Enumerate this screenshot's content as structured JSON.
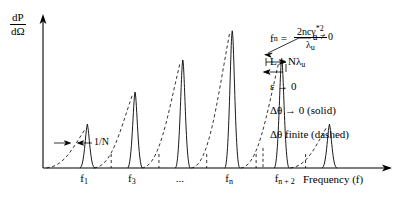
{
  "axes": {
    "y_label_numerator": "dP",
    "y_label_denominator": "dΩ",
    "x_title": "Frequency (f)"
  },
  "annotations": {
    "width_label": "1/N",
    "aperture_label": "a ≠ 0"
  },
  "equations": {
    "fn_lhs": "f",
    "fn_sub": "n",
    "fn_eq": "=",
    "fn_num": "2ncγ*2",
    "fn_den": "λu",
    "line_L": "L = Nλu",
    "line_eps": "ε → 0",
    "line_solid": "Δθ → 0 (solid)",
    "line_dashed": "Δθ  finite (dashed)"
  },
  "chart_data": {
    "type": "line",
    "title": "",
    "xlabel": "Frequency (f)",
    "ylabel": "dP/dΩ",
    "grid": false,
    "legend_position": "right",
    "xlim": [
      0,
      100
    ],
    "ylim": [
      0,
      100
    ],
    "axis_tick_labels": [
      {
        "text": "f",
        "sub": "1",
        "x": 13.0
      },
      {
        "text": "f",
        "sub": "3",
        "x": 27.0
      },
      {
        "text": "...",
        "sub": "",
        "x": 41.0
      },
      {
        "text": "f",
        "sub": "n",
        "x": 55.5
      },
      {
        "text": "f",
        "sub": "n + 2",
        "x": 70.0
      },
      {
        "text": "",
        "sub": "",
        "x": 84.0
      }
    ],
    "series": [
      {
        "name": "Δθ → 0 (solid)",
        "style": "solid",
        "comment": "narrow harmonic spikes; x in % of axis, peak height in % of plot height",
        "peaks": [
          {
            "x": 13.0,
            "height": 30.0,
            "halfwidth": 1.05
          },
          {
            "x": 27.0,
            "height": 52.0,
            "halfwidth": 1.05
          },
          {
            "x": 41.0,
            "height": 74.0,
            "halfwidth": 1.05
          },
          {
            "x": 55.5,
            "height": 94.0,
            "halfwidth": 1.05
          },
          {
            "x": 70.0,
            "height": 75.0,
            "halfwidth": 1.05
          },
          {
            "x": 84.0,
            "height": 30.0,
            "halfwidth": 1.05
          }
        ]
      },
      {
        "name": "Δθ finite (dashed)",
        "style": "dashed",
        "comment": "asymmetric broadened lineshapes rising from the left toward each spike",
        "lobes": [
          {
            "start_x": 1.0,
            "peak_x": 12.2,
            "height": 26.0
          },
          {
            "start_x": 15.0,
            "peak_x": 26.2,
            "height": 50.0
          },
          {
            "start_x": 29.0,
            "peak_x": 40.2,
            "height": 72.0
          },
          {
            "start_x": 43.5,
            "peak_x": 54.7,
            "height": 92.0
          },
          {
            "start_x": 58.0,
            "peak_x": 69.2,
            "height": 73.0
          },
          {
            "start_x": 72.5,
            "peak_x": 83.2,
            "height": 28.0
          }
        ]
      }
    ],
    "minor_ticks_x": [
      20.0,
      34.0,
      48.0,
      62.5,
      77.0
    ],
    "minor_tick_style": "dashed",
    "callouts": [
      {
        "label": "1/N",
        "target_x": 13.0,
        "kind": "double-arrow-width"
      },
      {
        "label": "a ≠ 0",
        "target_x": 70.0,
        "kind": "leader-to-broadened-width"
      }
    ]
  }
}
